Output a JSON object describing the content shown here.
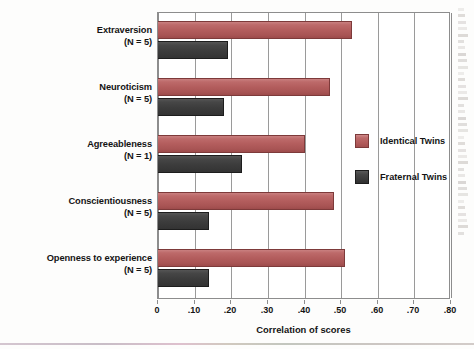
{
  "chart_data": {
    "type": "bar",
    "orientation": "horizontal",
    "title": "",
    "xlabel": "Correlation of scores",
    "ylabel": "",
    "xlim": [
      0,
      0.8
    ],
    "xticks": [
      0,
      0.1,
      0.2,
      0.3,
      0.4,
      0.5,
      0.6,
      0.7,
      0.8
    ],
    "xtick_labels": [
      "0",
      ".10",
      ".20",
      ".30",
      ".40",
      ".50",
      ".60",
      ".70",
      ".80"
    ],
    "grid": "vertical",
    "legend_position": "right-inside",
    "categories": [
      "Extraversion",
      "Neuroticism",
      "Agreeableness",
      "Conscientiousness",
      "Openness to experience"
    ],
    "category_sublabels": [
      "(N = 5)",
      "(N = 5)",
      "(N = 1)",
      "(N = 5)",
      "(N = 5)"
    ],
    "series": [
      {
        "name": "Identical Twins",
        "color": "#b35d5d",
        "values": [
          0.53,
          0.47,
          0.4,
          0.48,
          0.51
        ]
      },
      {
        "name": "Fraternal Twins",
        "color": "#3c3c3c",
        "values": [
          0.19,
          0.18,
          0.23,
          0.14,
          0.14
        ]
      }
    ]
  },
  "axis": {
    "x_title": "Correlation of scores",
    "tick_labels": [
      "0",
      ".10",
      ".20",
      ".30",
      ".40",
      ".50",
      ".60",
      ".70",
      ".80"
    ]
  },
  "categories": [
    {
      "name": "Extraversion",
      "n_label": "(N = 5)"
    },
    {
      "name": "Neuroticism",
      "n_label": "(N = 5)"
    },
    {
      "name": "Agreeableness",
      "n_label": "(N = 1)"
    },
    {
      "name": "Conscientiousness",
      "n_label": "(N = 5)"
    },
    {
      "name": "Openness to experience",
      "n_label": "(N = 5)"
    }
  ],
  "legend": {
    "items": [
      {
        "label": "Identical Twins",
        "color": "#b35d5d"
      },
      {
        "label": "Fraternal Twins",
        "color": "#3c3c3c"
      }
    ]
  },
  "colors": {
    "identical": "#b35d5d",
    "fraternal": "#3c3c3c",
    "grid": "#9a9a9a",
    "frame": "#8d8d8d",
    "text": "#141414",
    "background": "#fdfdfc"
  }
}
